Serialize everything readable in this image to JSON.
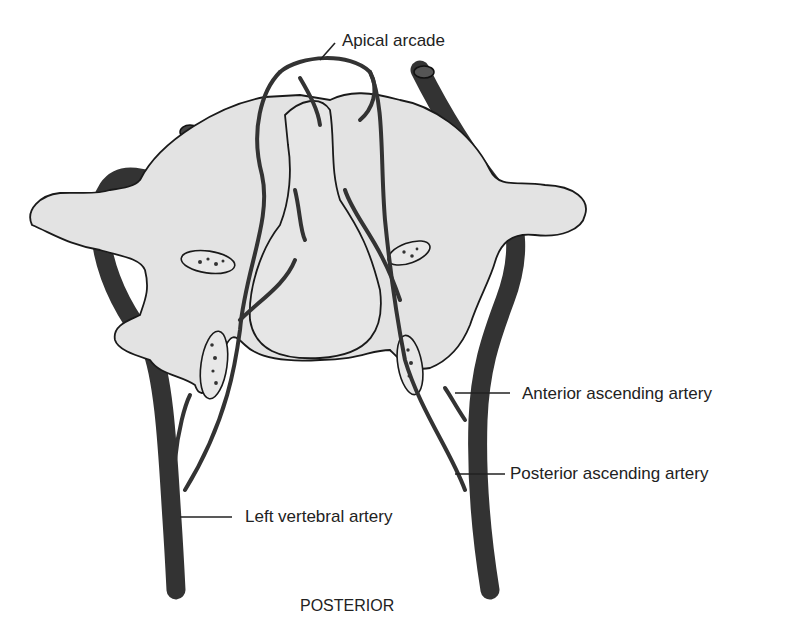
{
  "figure": {
    "orientation_label": "POSTERIOR",
    "labels": {
      "apical_arcade": "Apical arcade",
      "anterior_ascending_artery": "Anterior ascending artery",
      "posterior_ascending_artery": "Posterior ascending artery",
      "left_vertebral_artery": "Left vertebral artery"
    },
    "colors": {
      "bone_fill": "#e3e3e3",
      "outline": "#1a1a1a",
      "vessel": "#333333",
      "text": "#222222"
    }
  }
}
